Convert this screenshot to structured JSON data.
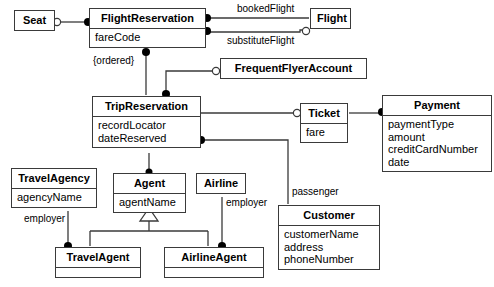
{
  "diagram": {
    "type": "uml-class-diagram",
    "colors": {
      "line": "#3a3a3a",
      "fill": "#ffffff",
      "text": "#000000"
    },
    "classes": [
      {
        "id": "seat",
        "name": "Seat",
        "attributes": []
      },
      {
        "id": "flightReservation",
        "name": "FlightReservation",
        "attributes": [
          "fareCode"
        ]
      },
      {
        "id": "flight",
        "name": "Flight",
        "attributes": []
      },
      {
        "id": "frequentFlyerAccount",
        "name": "FrequentFlyerAccount",
        "attributes": []
      },
      {
        "id": "tripReservation",
        "name": "TripReservation",
        "attributes": [
          "recordLocator",
          "dateReserved"
        ]
      },
      {
        "id": "ticket",
        "name": "Ticket",
        "attributes": [
          "fare"
        ]
      },
      {
        "id": "payment",
        "name": "Payment",
        "attributes": [
          "paymentType",
          "amount",
          "creditCardNumber",
          "date"
        ]
      },
      {
        "id": "travelAgency",
        "name": "TravelAgency",
        "attributes": [
          "agencyName"
        ]
      },
      {
        "id": "agent",
        "name": "Agent",
        "attributes": [
          "agentName"
        ]
      },
      {
        "id": "airline",
        "name": "Airline",
        "attributes": []
      },
      {
        "id": "customer",
        "name": "Customer",
        "attributes": [
          "customerName",
          "address",
          "phoneNumber"
        ]
      },
      {
        "id": "travelAgent",
        "name": "TravelAgent",
        "attributes": []
      },
      {
        "id": "airlineAgent",
        "name": "AirlineAgent",
        "attributes": []
      }
    ],
    "edge_labels": {
      "bookedFlight": "bookedFlight",
      "substituteFlight": "substituteFlight",
      "ordered": "{ordered}",
      "passenger": "passenger",
      "employerLeft": "employer",
      "employerRight": "employer"
    },
    "associations": [
      {
        "from": "flightReservation",
        "to": "seat",
        "label": ""
      },
      {
        "from": "flightReservation",
        "to": "flight",
        "label": "bookedFlight"
      },
      {
        "from": "flightReservation",
        "to": "flight",
        "label": "substituteFlight"
      },
      {
        "from": "tripReservation",
        "to": "flightReservation",
        "label": "{ordered}"
      },
      {
        "from": "tripReservation",
        "to": "frequentFlyerAccount",
        "label": ""
      },
      {
        "from": "tripReservation",
        "to": "ticket",
        "label": ""
      },
      {
        "from": "ticket",
        "to": "payment",
        "label": ""
      },
      {
        "from": "tripReservation",
        "to": "customer",
        "label": "passenger"
      },
      {
        "from": "tripReservation",
        "to": "agent",
        "label": ""
      },
      {
        "from": "travelAgency",
        "to": "travelAgent",
        "label": "employer"
      },
      {
        "from": "airline",
        "to": "airlineAgent",
        "label": "employer"
      }
    ],
    "generalizations": [
      {
        "parent": "agent",
        "children": [
          "travelAgent",
          "airlineAgent"
        ]
      }
    ]
  }
}
